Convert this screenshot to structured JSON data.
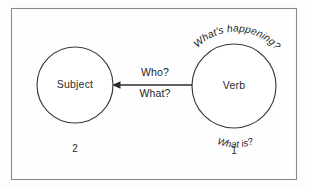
{
  "diagram": {
    "type": "concept-diagram",
    "frame": {
      "border_color": "#8a8a8a",
      "background_color": "#fefefe"
    },
    "nodes": [
      {
        "id": "subject",
        "label": "Subject",
        "order_number": "2",
        "cx": 75,
        "cy": 85,
        "r": 38
      },
      {
        "id": "verb",
        "label": "Verb",
        "order_number": "1",
        "cx": 234,
        "cy": 86,
        "r": 42
      }
    ],
    "edges": [
      {
        "id": "verb-to-subject",
        "from": "verb",
        "to": "subject",
        "direction": "left",
        "label_above": "Who?",
        "label_below": "What?"
      }
    ],
    "annotations": [
      {
        "id": "verb-top-arc",
        "text": "What's happening?",
        "attached_to": "verb",
        "position": "top-arc"
      },
      {
        "id": "verb-bottom-arc",
        "text": "What is?",
        "attached_to": "verb",
        "position": "bottom-arc"
      }
    ],
    "colors": {
      "stroke": "#3a3a3a",
      "text": "#1f1f1f",
      "arrow": "#2b2b2b"
    }
  }
}
